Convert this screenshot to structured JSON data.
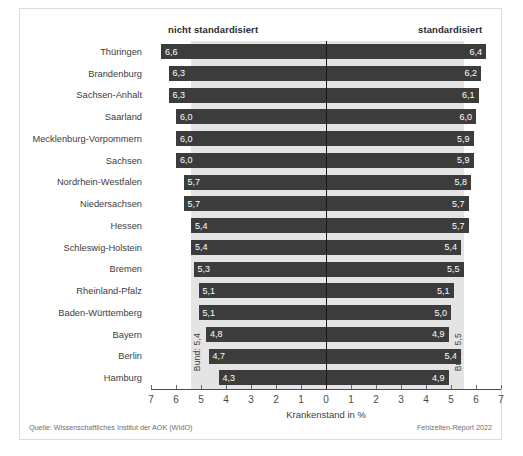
{
  "header": {
    "left_label": "nicht standardisiert",
    "right_label": "standardisiert"
  },
  "axis": {
    "title": "Krankenstand in %",
    "tick_labels": [
      "7",
      "6",
      "5",
      "4",
      "3",
      "2",
      "1",
      "0",
      "1",
      "2",
      "3",
      "4",
      "5",
      "6",
      "7"
    ]
  },
  "annotations": {
    "bund_left": "Bund: 5,4",
    "bund_right": "Bund: 5,5"
  },
  "footer": {
    "source": "Quelle: Wissenschaftliches Institut der AOK (WIdO)",
    "report": "Fehlzeiten-Report 2022"
  },
  "colors": {
    "bar": "#3c3c3c",
    "band": "#e4e4e4",
    "zero_line": "#1a1a1a",
    "background": "#ffffff"
  },
  "chart_data": {
    "type": "bar",
    "title": "",
    "subtitle": "",
    "xlabel": "Krankenstand in %",
    "ylabel": "",
    "orientation": "horizontal",
    "layout": "diverging-bidirectional",
    "xlim": [
      -7,
      7
    ],
    "xticks": [
      7,
      6,
      5,
      4,
      3,
      2,
      1,
      0,
      1,
      2,
      3,
      4,
      5,
      6,
      7
    ],
    "grid": false,
    "legend_position": "top",
    "categories": [
      "Thüringen",
      "Brandenburg",
      "Sachsen-Anhalt",
      "Saarland",
      "Mecklenburg-Vorpommern",
      "Sachsen",
      "Nordrhein-Westfalen",
      "Niedersachsen",
      "Hessen",
      "Schleswig-Holstein",
      "Bremen",
      "Rheinland-Pfalz",
      "Baden-Württemberg",
      "Bayern",
      "Berlin",
      "Hamburg"
    ],
    "series": [
      {
        "name": "nicht standardisiert",
        "direction": "left",
        "values": [
          6.6,
          6.3,
          6.3,
          6.0,
          6.0,
          6.0,
          5.7,
          5.7,
          5.4,
          5.4,
          5.3,
          5.1,
          5.1,
          4.8,
          4.7,
          4.3
        ],
        "labels": [
          "6,6",
          "6,3",
          "6,3",
          "6,0",
          "6,0",
          "6,0",
          "5,7",
          "5,7",
          "5,4",
          "5,4",
          "5,3",
          "5,1",
          "5,1",
          "4,8",
          "4,7",
          "4,3"
        ]
      },
      {
        "name": "standardisiert",
        "direction": "right",
        "values": [
          6.4,
          6.2,
          6.1,
          6.0,
          5.9,
          5.9,
          5.8,
          5.7,
          5.7,
          5.4,
          5.5,
          5.1,
          5.0,
          4.9,
          5.4,
          4.9
        ],
        "labels": [
          "6,4",
          "6,2",
          "6,1",
          "6,0",
          "5,9",
          "5,9",
          "5,8",
          "5,7",
          "5,7",
          "5,4",
          "5,5",
          "5,1",
          "5,0",
          "4,9",
          "5,4",
          "4,9"
        ]
      }
    ],
    "reference_lines": [
      {
        "name": "Bund nicht standardisiert",
        "side": "left",
        "value": 5.4,
        "label": "Bund: 5,4"
      },
      {
        "name": "Bund standardisiert",
        "side": "right",
        "value": 5.5,
        "label": "Bund: 5,5"
      }
    ]
  }
}
